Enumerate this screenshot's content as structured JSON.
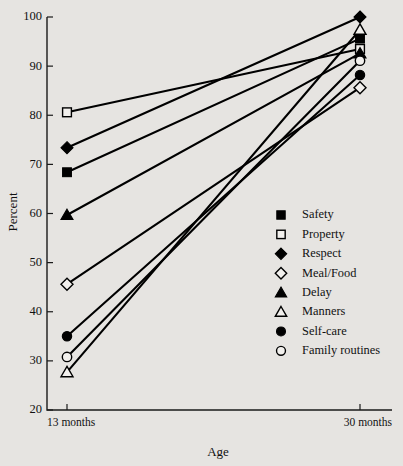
{
  "chart_data": {
    "type": "line",
    "title": "",
    "subtitle": "",
    "xlabel": "Age",
    "ylabel": "Percent",
    "categories": [
      "13 months",
      "30 months"
    ],
    "x": [
      0,
      1
    ],
    "xtick_labels": [
      "13 months",
      "30 months"
    ],
    "ytick_labels": [
      "20",
      "30",
      "40",
      "50",
      "60",
      "70",
      "80",
      "90",
      "100"
    ],
    "yticks": [
      20,
      30,
      40,
      50,
      60,
      70,
      80,
      90,
      100
    ],
    "ylim": [
      20,
      100
    ],
    "xlim": [
      0,
      1
    ],
    "grid": false,
    "legend_position": "inside-right-lower",
    "series": [
      {
        "name": "Safety",
        "marker": "filled-square",
        "values": [
          68.4,
          95.6
        ]
      },
      {
        "name": "Property",
        "marker": "open-square",
        "values": [
          80.6,
          93.5
        ]
      },
      {
        "name": "Respect",
        "marker": "filled-diamond",
        "values": [
          73.4,
          100.0
        ]
      },
      {
        "name": "Meal/Food",
        "marker": "open-diamond",
        "values": [
          45.6,
          85.6
        ]
      },
      {
        "name": "Delay",
        "marker": "filled-triangle",
        "values": [
          59.7,
          92.6
        ]
      },
      {
        "name": "Manners",
        "marker": "open-triangle",
        "values": [
          27.7,
          97.4
        ]
      },
      {
        "name": "Self-care",
        "marker": "filled-circle",
        "values": [
          35.0,
          88.2
        ]
      },
      {
        "name": "Family routines",
        "marker": "open-circle",
        "values": [
          30.8,
          91.1
        ]
      }
    ],
    "colors": {
      "background": "#e6e4e1",
      "plot_background": "#e6e4e1",
      "line": "#000000",
      "marker_fill": "#000000",
      "marker_open_fill": "#f2f0ed",
      "axis": "#1a1a1a",
      "text": "#111111"
    }
  },
  "legend": {
    "items": [
      {
        "label": "Safety",
        "marker": "filled-square"
      },
      {
        "label": "Property",
        "marker": "open-square"
      },
      {
        "label": "Respect",
        "marker": "filled-diamond"
      },
      {
        "label": "Meal/Food",
        "marker": "open-diamond"
      },
      {
        "label": "Delay",
        "marker": "filled-triangle"
      },
      {
        "label": "Manners",
        "marker": "open-triangle"
      },
      {
        "label": "Self-care",
        "marker": "filled-circle"
      },
      {
        "label": "Family routines",
        "marker": "open-circle"
      }
    ]
  },
  "axes": {
    "y_title": "Percent",
    "x_title": "Age",
    "x_labels": [
      "13 months",
      "30 months"
    ],
    "y_labels": [
      "100",
      "90",
      "80",
      "70",
      "60",
      "50",
      "40",
      "30",
      "20"
    ]
  }
}
